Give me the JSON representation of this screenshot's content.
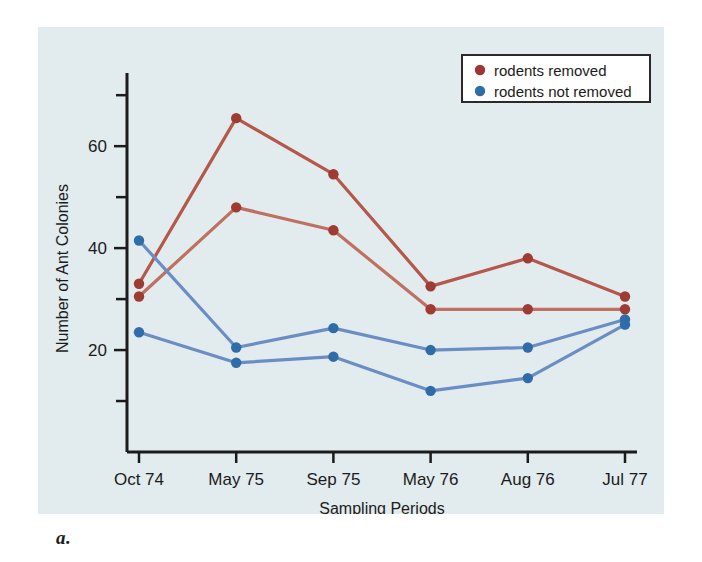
{
  "figure": {
    "caption": "a.",
    "panel_background": "#e2ebee"
  },
  "legend": {
    "position": "top-right",
    "border_color": "#2a2a2a",
    "background": "#ffffff",
    "entries": [
      {
        "label": "rodents removed",
        "color": "#a03634",
        "marker": "circle"
      },
      {
        "label": "rodents not removed",
        "color": "#2f6ca8",
        "marker": "circle"
      }
    ]
  },
  "chart_data": {
    "type": "line",
    "title": "",
    "xlabel": "Sampling Periods",
    "ylabel": "Number of Ant Colonies",
    "categories": [
      "Oct 74",
      "May 75",
      "Sep 75",
      "May 76",
      "Aug 76",
      "Jul 77"
    ],
    "ylim": [
      0,
      72
    ],
    "y_ticks_major": [
      20,
      40,
      60
    ],
    "y_ticks_minor": [
      10,
      30,
      50,
      70
    ],
    "y_tick_labels": [
      "20",
      "40",
      "60"
    ],
    "grid": false,
    "series": [
      {
        "name": "rodents removed (plot 1)",
        "group": "rodents removed",
        "color": "#b5574b",
        "values": [
          33.0,
          65.5,
          54.5,
          32.5,
          38.0,
          30.5
        ]
      },
      {
        "name": "rodents removed (plot 2)",
        "group": "rodents removed",
        "color": "#bf7060",
        "values": [
          30.5,
          48.0,
          43.5,
          28.0,
          28.0,
          28.0
        ]
      },
      {
        "name": "rodents not removed (plot 1)",
        "group": "rodents not removed",
        "color": "#6a8ec4",
        "values": [
          41.5,
          20.5,
          24.3,
          20.0,
          20.5,
          26.0
        ]
      },
      {
        "name": "rodents not removed (plot 2)",
        "group": "rodents not removed",
        "color": "#6a8ec4",
        "values": [
          23.5,
          17.5,
          18.7,
          12.0,
          14.5,
          25.0
        ]
      }
    ],
    "marker_colors": {
      "rodents removed": "#9e3b33",
      "rodents not removed": "#2f6ca8"
    }
  }
}
